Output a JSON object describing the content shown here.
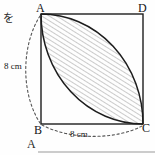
{
  "figure": {
    "type": "geometry-diagram",
    "square": {
      "vertices": [
        {
          "name": "A",
          "label": "A",
          "position": "top-left"
        },
        {
          "name": "D",
          "label": "D",
          "position": "top-right"
        },
        {
          "name": "B",
          "label": "B",
          "position": "bottom-left"
        },
        {
          "name": "C",
          "label": "C",
          "position": "bottom-right"
        }
      ],
      "side_length_value": "8",
      "side_length_unit": "cm"
    },
    "dimensions": [
      {
        "id": "left-side",
        "label": "8 cm",
        "edge": "A-B"
      },
      {
        "id": "bottom-side",
        "label": "8 cm",
        "edge": "B-C"
      }
    ],
    "shaded_region": {
      "name": "lens",
      "hatching": "diagonal-lines",
      "arcs": [
        {
          "center": "B",
          "from": "A",
          "to": "C"
        },
        {
          "center": "D",
          "from": "A",
          "to": "C"
        }
      ]
    },
    "annotations": {
      "kana": "を",
      "next_item": "A"
    },
    "colors": {
      "stroke": "#1d1d1d",
      "hatch": "#8c8c8c",
      "dashed": "#555555",
      "background": "#fefefe"
    }
  }
}
